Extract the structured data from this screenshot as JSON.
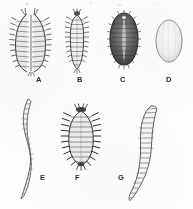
{
  "plate": {
    "background_color": "#fdfdfc",
    "ink_color": "#3a3a3a",
    "width": 193,
    "height": 209,
    "rows": 2,
    "figure_count": 7
  },
  "figures": [
    {
      "label": "A",
      "name": "specimen-a",
      "row": 1,
      "description": "elongate spiny larva, split median view",
      "shape": "elongate-oval-paired",
      "shading": "medium-stippled",
      "label_x": 36,
      "label_y": 76
    },
    {
      "label": "B",
      "name": "specimen-b",
      "row": 1,
      "description": "narrow segmented larva with lateral setae",
      "shape": "narrow-elongate",
      "shading": "light-outline",
      "label_x": 77,
      "label_y": 76
    },
    {
      "label": "C",
      "name": "specimen-c",
      "row": 1,
      "description": "dark oval scale with pale median stripe and marginal fringe",
      "shape": "broad-oval",
      "shading": "dark-dense",
      "label_x": 120,
      "label_y": 76
    },
    {
      "label": "D",
      "name": "specimen-d",
      "row": 1,
      "description": "pale smooth oval, faintly stippled",
      "shape": "oval",
      "shading": "very-light",
      "label_x": 166,
      "label_y": 76
    },
    {
      "label": "E",
      "name": "specimen-e",
      "row": 2,
      "description": "slender sinuous segmented larva",
      "shape": "sinuous-vermiform",
      "shading": "light-outline",
      "label_x": 40,
      "label_y": 174
    },
    {
      "label": "F",
      "name": "specimen-f",
      "row": 2,
      "description": "broad oval larva with prominent lateral spine processes",
      "shape": "broad-oval-spined",
      "shading": "medium-dense",
      "label_x": 75,
      "label_y": 174
    },
    {
      "label": "G",
      "name": "specimen-g",
      "row": 2,
      "description": "curved segmented grub",
      "shape": "curved-vermiform",
      "shading": "light-outline",
      "label_x": 118,
      "label_y": 174
    }
  ]
}
